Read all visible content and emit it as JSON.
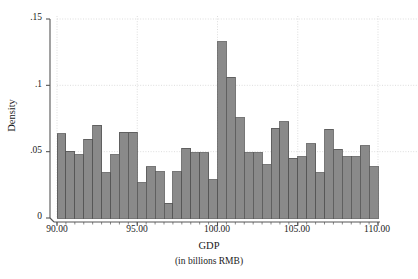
{
  "chart_data": {
    "type": "bar",
    "title": "",
    "subtitle": "",
    "xlabel": "GDP",
    "xlabel_units": "(in billions RMB)",
    "ylabel": "Density",
    "xlim": [
      90.0,
      110.0
    ],
    "ylim": [
      0,
      0.15
    ],
    "grid": true,
    "legend": null,
    "bin_width": 0.5555,
    "bar_color": "#8a8a8a",
    "bar_edge_color": "#555555",
    "grid_color": "#cfcfcf",
    "axis_color": "#555555",
    "xtick_labels": [
      "90.00",
      "95.00",
      "100.00",
      "105.00",
      "110.00"
    ],
    "xtick_values": [
      90.0,
      95.0,
      100.0,
      105.0,
      110.0
    ],
    "ytick_labels": [
      "0",
      ".05",
      ".1",
      ".15"
    ],
    "ytick_values": [
      0,
      0.05,
      0.1,
      0.15
    ],
    "categories": [
      "90.00",
      "90.56",
      "91.11",
      "91.67",
      "92.22",
      "92.78",
      "93.33",
      "93.89",
      "94.44",
      "95.00",
      "95.56",
      "96.11",
      "96.67",
      "97.22",
      "97.78",
      "98.33",
      "98.89",
      "99.44",
      "100.00",
      "100.56",
      "101.11",
      "101.67",
      "102.22",
      "102.78",
      "103.33",
      "103.89",
      "104.44",
      "105.00",
      "105.56",
      "106.11",
      "106.67",
      "107.22",
      "107.78",
      "108.33",
      "108.89",
      "109.44"
    ],
    "values": [
      0.0635,
      0.0505,
      0.0475,
      0.0595,
      0.07,
      0.034,
      0.0475,
      0.0645,
      0.0645,
      0.0265,
      0.0385,
      0.035,
      0.011,
      0.035,
      0.0525,
      0.049,
      0.049,
      0.029,
      0.133,
      0.106,
      0.0755,
      0.049,
      0.049,
      0.04,
      0.0675,
      0.0725,
      0.045,
      0.046,
      0.056,
      0.034,
      0.067,
      0.052,
      0.046,
      0.046,
      0.0545,
      0.0385
    ]
  }
}
